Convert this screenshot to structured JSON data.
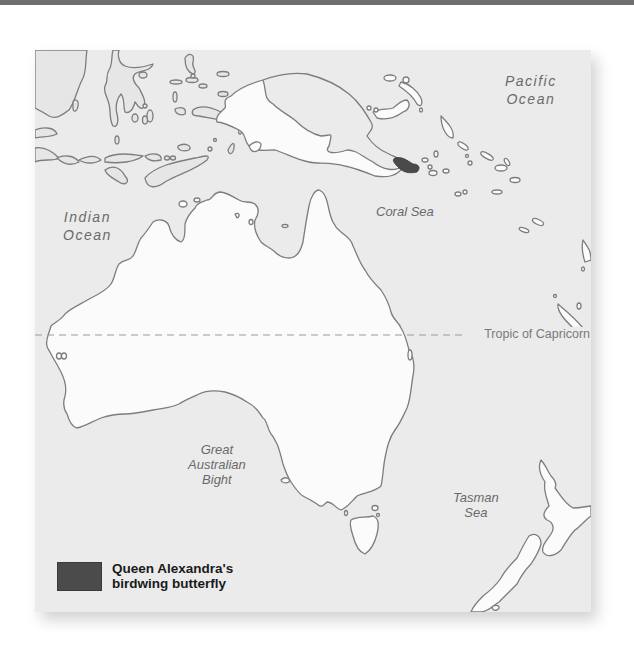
{
  "map": {
    "title": "Range map of Queen Alexandra's birdwing butterfly",
    "ocean_labels": {
      "pacific_line1": "Pacific",
      "pacific_line2": "Ocean",
      "indian_line1": "Indian",
      "indian_line2": "Ocean",
      "coral_sea": "Coral Sea",
      "bight_line1": "Great",
      "bight_line2": "Australian",
      "bight_line3": "Bight",
      "tasman_line1": "Tasman",
      "tasman_line2": "Sea"
    },
    "tropic_label": "Tropic of Capricorn",
    "legend": {
      "swatch_color": "#4b4b4b",
      "label_line1": "Queen Alexandra's",
      "label_line2": "birdwing butterfly"
    },
    "colors": {
      "sea": "#ebebeb",
      "land": "#fbfbfb",
      "coastline": "#7d7d7d",
      "range": "#4a4a4a"
    }
  }
}
